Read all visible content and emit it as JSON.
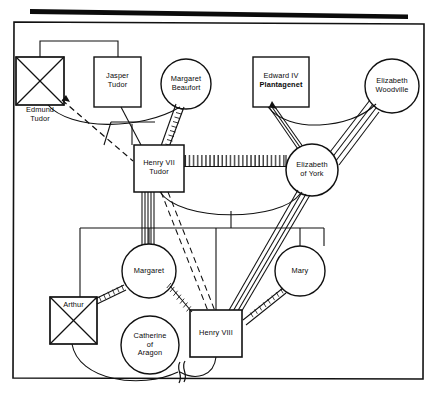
{
  "figure": {
    "type": "genogram",
    "title_bar": "solid-black-rule",
    "frame": "thin-black-rectangle-border"
  },
  "persons": [
    {
      "id": "edmund-tudor",
      "label": "Edmund\nTudor",
      "shape": "square",
      "sex": "male",
      "deceased": true,
      "label_position": "below-left",
      "x": 16,
      "y": 57,
      "w": 48,
      "h": 48
    },
    {
      "id": "jasper-tudor",
      "label": "Jasper\nTudor",
      "shape": "square",
      "sex": "male",
      "deceased": false,
      "label_position": "inside",
      "x": 94,
      "y": 57,
      "w": 47,
      "h": 50
    },
    {
      "id": "margaret-beaufort",
      "label": "Margaret\nBeaufort",
      "shape": "circle",
      "sex": "female",
      "deceased": false,
      "label_position": "inside",
      "cx": 186,
      "cy": 84,
      "r": 25
    },
    {
      "id": "edward-iv-plantagenet",
      "label_line1": "Edward IV",
      "label_line2": "Plantagenet",
      "label_line2_bold": true,
      "shape": "square",
      "sex": "male",
      "deceased": false,
      "label_position": "inside",
      "x": 253,
      "y": 57,
      "w": 56,
      "h": 50
    },
    {
      "id": "elizabeth-woodville",
      "label": "Elizabeth\nWoodville",
      "shape": "circle",
      "sex": "female",
      "deceased": false,
      "label_position": "inside",
      "cx": 392,
      "cy": 86,
      "r": 27
    },
    {
      "id": "henry-vii-tudor",
      "label": "Henry VII\nTudor",
      "shape": "square",
      "sex": "male",
      "deceased": false,
      "label_position": "inside",
      "x": 134,
      "y": 145,
      "w": 50,
      "h": 47
    },
    {
      "id": "elizabeth-of-york",
      "label": "Elizabeth\nof York",
      "shape": "circle",
      "sex": "female",
      "deceased": false,
      "label_position": "inside",
      "cx": 312,
      "cy": 170,
      "r": 26
    },
    {
      "id": "margaret",
      "label": "Margaret",
      "shape": "circle",
      "sex": "female",
      "deceased": false,
      "label_position": "inside",
      "cx": 149,
      "cy": 271,
      "r": 27
    },
    {
      "id": "mary",
      "label": "Mary",
      "shape": "circle",
      "sex": "female",
      "deceased": false,
      "label_position": "inside",
      "cx": 300,
      "cy": 271,
      "r": 25
    },
    {
      "id": "arthur",
      "label": "Arthur",
      "shape": "square",
      "sex": "male",
      "deceased": true,
      "label_position": "inside-top",
      "x": 50,
      "y": 297,
      "w": 47,
      "h": 47
    },
    {
      "id": "catherine-of-aragon",
      "label": "Catherine\nof\nAragon",
      "shape": "circle",
      "sex": "female",
      "deceased": false,
      "label_position": "inside",
      "cx": 150,
      "cy": 345,
      "r": 29
    },
    {
      "id": "henry-viii",
      "label": "Henry VIII",
      "shape": "square",
      "sex": "male",
      "deceased": false,
      "label_position": "inside",
      "x": 190,
      "y": 310,
      "w": 52,
      "h": 47
    }
  ],
  "relationships": [
    {
      "from": "edmund-tudor",
      "to": "margaret-beaufort",
      "type": "marriage-plain-curve"
    },
    {
      "from": "margaret-beaufort",
      "to": "henry-vii-tudor",
      "type": "descent-hatched"
    },
    {
      "from": "edmund-tudor",
      "to": "henry-vii-tudor",
      "type": "dashed"
    },
    {
      "from": "jasper-tudor",
      "to": "henry-vii-tudor",
      "type": "plain"
    },
    {
      "from": "edmund-tudor",
      "to": "jasper-tudor",
      "type": "sibling-bracket"
    },
    {
      "from": "edward-iv-plantagenet",
      "to": "elizabeth-woodville",
      "type": "marriage-plain-curve"
    },
    {
      "from": "edward-iv-plantagenet",
      "to": "elizabeth-of-york",
      "type": "descent-double"
    },
    {
      "from": "elizabeth-woodville",
      "to": "elizabeth-of-york",
      "type": "descent-triple"
    },
    {
      "from": "henry-vii-tudor",
      "to": "elizabeth-of-york",
      "type": "marriage-hatched-ladder"
    },
    {
      "from": "henry-vii-tudor",
      "to": "margaret",
      "type": "descent-multi"
    },
    {
      "from": "henry-vii-tudor",
      "to": "henry-viii",
      "type": "dashed-double"
    },
    {
      "from": "elizabeth-of-york",
      "to": "henry-viii",
      "type": "descent-multi"
    },
    {
      "from": "margaret",
      "to": "arthur",
      "type": "hatched-double"
    },
    {
      "from": "margaret",
      "to": "henry-viii",
      "type": "hatched"
    },
    {
      "from": "mary",
      "to": "henry-viii",
      "type": "hatched-double"
    },
    {
      "from": "arthur",
      "to": "catherine-of-aragon",
      "type": "marriage-plain-curve"
    },
    {
      "from": "catherine-of-aragon",
      "to": "henry-viii",
      "type": "marriage-broken",
      "marker": "divorce-break"
    }
  ],
  "legend_symbols": {
    "square": "male",
    "circle": "female",
    "x-through-shape": "deceased",
    "double-slash-break": "divorce",
    "hatched-line": "fused-relationship",
    "dashed-line": "distant-relationship"
  }
}
